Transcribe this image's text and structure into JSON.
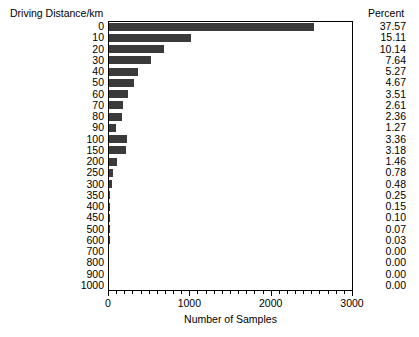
{
  "chart_data": {
    "type": "bar",
    "orientation": "horizontal",
    "title": "",
    "xlabel": "Number of Samples",
    "ylabel": "Driving Distance/km",
    "categories": [
      "0",
      "10",
      "20",
      "30",
      "40",
      "50",
      "60",
      "70",
      "80",
      "90",
      "100",
      "150",
      "200",
      "250",
      "300",
      "350",
      "400",
      "450",
      "500",
      "600",
      "700",
      "800",
      "900",
      "1000"
    ],
    "values": [
      2517,
      1012,
      679,
      512,
      353,
      313,
      235,
      175,
      158,
      85,
      225,
      213,
      98,
      52,
      32,
      17,
      10,
      7,
      5,
      2,
      0,
      0,
      0,
      0
    ],
    "percent_header": "Percent",
    "percents": [
      "37.57",
      "15.11",
      "10.14",
      "7.64",
      "5.27",
      "4.67",
      "3.51",
      "2.61",
      "2.36",
      "1.27",
      "3.36",
      "3.18",
      "1.46",
      "0.78",
      "0.48",
      "0.25",
      "0.15",
      "0.10",
      "0.07",
      "0.03",
      "0.00",
      "0.00",
      "0.00",
      "0.00"
    ],
    "xlim": [
      0,
      3000
    ],
    "xticks": [
      0,
      1000,
      2000,
      3000
    ],
    "xtick_labels": [
      "0",
      "1000",
      "2000",
      "3000"
    ],
    "minor_tick_step": 100,
    "grid": false,
    "legend": "none",
    "bar_color": "#3a3a3a",
    "frame_color": "#000000",
    "background_color": "#ffffff"
  }
}
